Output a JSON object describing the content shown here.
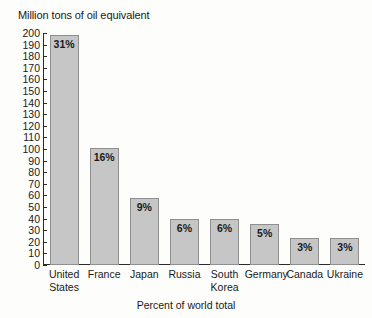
{
  "chart_data": {
    "type": "bar",
    "title": "",
    "ylabel": "Million tons of oil equivalent",
    "xlabel": "Percent of world total",
    "categories": [
      "United States",
      "France",
      "Japan",
      "Russia",
      "South Korea",
      "Germany",
      "Canada",
      "Ukraine"
    ],
    "category_lines": [
      [
        "United",
        "States"
      ],
      [
        "France"
      ],
      [
        "Japan"
      ],
      [
        "Russia"
      ],
      [
        "South",
        "Korea"
      ],
      [
        "Germany"
      ],
      [
        "Canada"
      ],
      [
        "Ukraine"
      ]
    ],
    "values": [
      198,
      101,
      58,
      40,
      40,
      35,
      23,
      23
    ],
    "data_labels": [
      "31%",
      "16%",
      "9%",
      "6%",
      "6%",
      "5%",
      "3%",
      "3%"
    ],
    "ylim": [
      0,
      200
    ],
    "ytick_step": 10,
    "ytick_labels": [
      "200",
      "190",
      "180",
      "170",
      "160",
      "150",
      "140",
      "130",
      "120",
      "110",
      "100",
      "90",
      "80",
      "70",
      "60",
      "50",
      "40",
      "30",
      "20",
      "10",
      "0"
    ],
    "grid": false,
    "legend": null,
    "bar_fill_color": "#c6c6c6",
    "bar_border_color": "#8f8f8f",
    "axis_color": "#2b2b2b",
    "background_color": "#fdfdfb"
  }
}
